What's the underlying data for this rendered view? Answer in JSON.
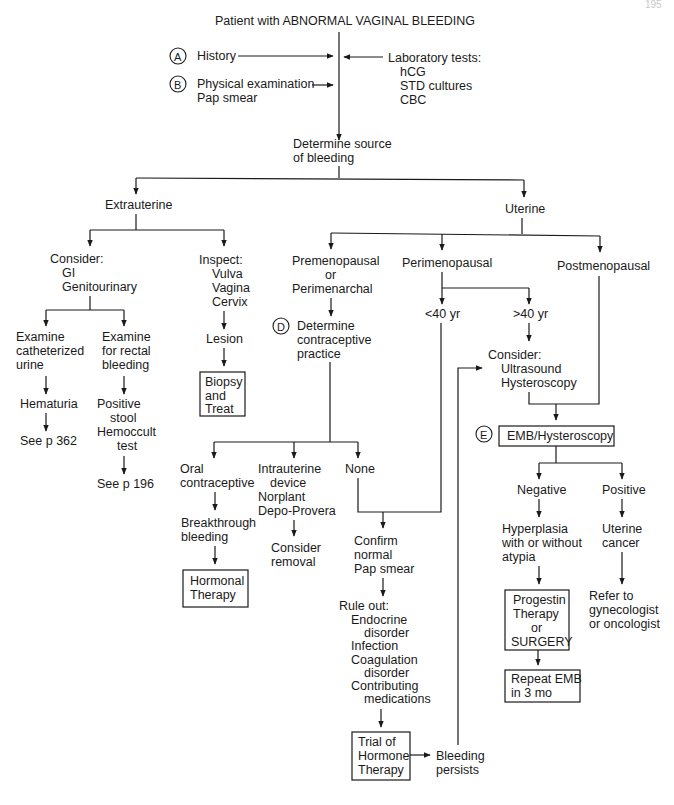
{
  "page": {
    "corner_mark": "195"
  },
  "title": "Patient with ABNORMAL VAGINAL BLEEDING",
  "step_a": {
    "letter": "A",
    "label": "History"
  },
  "step_b": {
    "letter": "B",
    "lines": [
      "Physical examination",
      "Pap smear"
    ]
  },
  "lab_tests": {
    "lines": [
      "Laboratory tests:",
      "hCG",
      "STD cultures",
      "CBC"
    ]
  },
  "determine_source": {
    "lines": [
      "Determine source",
      "of bleeding"
    ]
  },
  "extrauterine": {
    "label": "Extrauterine",
    "consider": {
      "lines": [
        "Consider:",
        "GI",
        "Genitourinary"
      ]
    },
    "catheterized": {
      "lines": [
        "Examine",
        "catheterized",
        "urine"
      ]
    },
    "hematuria": "Hematuria",
    "see_362": "See p 362",
    "rectal": {
      "lines": [
        "Examine",
        "for rectal",
        "bleeding"
      ]
    },
    "hemoccult": {
      "lines": [
        "Positive",
        "stool",
        "Hemoccult",
        "test"
      ]
    },
    "see_196": "See p 196",
    "inspect": {
      "lines": [
        "Inspect:",
        "Vulva",
        "Vagina",
        "Cervix"
      ]
    },
    "lesion": "Lesion",
    "biopsy": {
      "lines": [
        "Biopsy",
        "and",
        "Treat"
      ]
    }
  },
  "uterine": {
    "label": "Uterine",
    "premenopausal": {
      "lines": [
        "Premenopausal",
        "or",
        "Perimenarchal"
      ]
    },
    "perimenopausal": "Perimenopausal",
    "postmenopausal": "Postmenopausal",
    "under_40": "<40 yr",
    "over_40": ">40 yr",
    "consider_us": {
      "lines": [
        "Consider:",
        "Ultrasound",
        "Hysteroscopy"
      ]
    },
    "step_d": {
      "letter": "D",
      "lines": [
        "Determine",
        "contraceptive",
        "practice"
      ]
    },
    "oral": {
      "lines": [
        "Oral",
        "contraceptive"
      ]
    },
    "breakthrough": {
      "lines": [
        "Breakthrough",
        "bleeding"
      ]
    },
    "hormonal": {
      "lines": [
        "Hormonal",
        "Therapy"
      ]
    },
    "iud": {
      "lines": [
        "Intrauterine",
        "device",
        "Norplant",
        "Depo-Provera"
      ]
    },
    "removal": {
      "lines": [
        "Consider",
        "removal"
      ]
    },
    "none": "None",
    "confirm_pap": {
      "lines": [
        "Confirm",
        "normal",
        "Pap smear"
      ]
    },
    "rule_out": {
      "lines": [
        "Rule out:",
        "Endocrine",
        "disorder",
        "Infection",
        "Coagulation",
        "disorder",
        "Contributing",
        "medications"
      ]
    },
    "trial": {
      "lines": [
        "Trial of",
        "Hormone",
        "Therapy"
      ]
    },
    "persists": {
      "lines": [
        "Bleeding",
        "persists"
      ]
    },
    "step_e": {
      "letter": "E",
      "label": "EMB/Hysteroscopy"
    },
    "negative": "Negative",
    "positive": "Positive",
    "hyperplasia": {
      "lines": [
        "Hyperplasia",
        "with or without",
        "atypia"
      ]
    },
    "progestin": {
      "lines": [
        "Progestin",
        "Therapy",
        "or",
        "SURGERY"
      ]
    },
    "repeat_emb": {
      "lines": [
        "Repeat EMB",
        "in 3 mo"
      ]
    },
    "uterine_cancer": {
      "lines": [
        "Uterine",
        "cancer"
      ]
    },
    "refer": {
      "lines": [
        "Refer to",
        "gynecologist",
        "or oncologist"
      ]
    }
  }
}
